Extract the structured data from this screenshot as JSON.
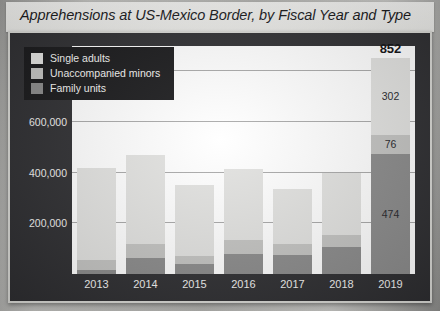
{
  "chart_title": "Apprehensions at US-Mexico Border, by Fiscal Year and Type",
  "legend": {
    "items": [
      {
        "label": "Single adults",
        "key": "single",
        "color": "#e2e2e0"
      },
      {
        "label": "Unaccompanied minors",
        "key": "minors",
        "color": "#c3c3c1"
      },
      {
        "label": "Family units",
        "key": "family",
        "color": "#8a8a8a"
      }
    ]
  },
  "axis": {
    "y_ticks": [
      "200,000",
      "400,000",
      "600,000",
      "800,000"
    ],
    "y_tick_values": [
      200000,
      400000,
      600000,
      800000
    ],
    "x_ticks": [
      "2013",
      "2014",
      "2015",
      "2016",
      "2017",
      "2018",
      "2019"
    ]
  },
  "chart_data": {
    "type": "bar",
    "title": "Apprehensions at US-Mexico Border, by Fiscal Year and Type",
    "subtitle": "",
    "xlabel": "",
    "ylabel": "",
    "stacked": true,
    "grid": true,
    "legend_position": "top-left",
    "ylim": [
      0,
      900000
    ],
    "units": "apprehensions",
    "label_units": "thousands",
    "categories": [
      "2013",
      "2014",
      "2015",
      "2016",
      "2017",
      "2018",
      "2019"
    ],
    "series": [
      {
        "name": "Family units",
        "key": "family",
        "color": "#8a8a8a",
        "values": [
          15000,
          65000,
          40000,
          80000,
          75000,
          105000,
          474000
        ]
      },
      {
        "name": "Unaccompanied minors",
        "key": "minors",
        "color": "#c3c3c1",
        "values": [
          40000,
          55000,
          30000,
          55000,
          45000,
          50000,
          76000
        ]
      },
      {
        "name": "Single adults",
        "key": "single",
        "color": "#e2e2e0",
        "values": [
          365000,
          350000,
          280000,
          280000,
          215000,
          245000,
          302000
        ]
      }
    ],
    "totals": [
      420000,
      470000,
      350000,
      415000,
      335000,
      400000,
      852000
    ],
    "bars": [
      {
        "year": "2013",
        "family": 15000,
        "minors": 40000,
        "single": 365000,
        "total": 420000,
        "total_label": "",
        "family_label": "",
        "minors_label": "",
        "single_label": ""
      },
      {
        "year": "2014",
        "family": 65000,
        "minors": 55000,
        "single": 350000,
        "total": 470000,
        "total_label": "",
        "family_label": "",
        "minors_label": "",
        "single_label": ""
      },
      {
        "year": "2015",
        "family": 40000,
        "minors": 30000,
        "single": 280000,
        "total": 350000,
        "total_label": "",
        "family_label": "",
        "minors_label": "",
        "single_label": ""
      },
      {
        "year": "2016",
        "family": 80000,
        "minors": 55000,
        "single": 280000,
        "total": 415000,
        "total_label": "",
        "family_label": "",
        "minors_label": "",
        "single_label": ""
      },
      {
        "year": "2017",
        "family": 75000,
        "minors": 45000,
        "single": 215000,
        "total": 335000,
        "total_label": "",
        "family_label": "",
        "minors_label": "",
        "single_label": ""
      },
      {
        "year": "2018",
        "family": 105000,
        "minors": 50000,
        "single": 245000,
        "total": 400000,
        "total_label": "",
        "family_label": "",
        "minors_label": "",
        "single_label": ""
      },
      {
        "year": "2019",
        "family": 474000,
        "minors": 76000,
        "single": 302000,
        "total": 852000,
        "total_label": "852",
        "family_label": "474",
        "minors_label": "76",
        "single_label": "302"
      }
    ]
  }
}
